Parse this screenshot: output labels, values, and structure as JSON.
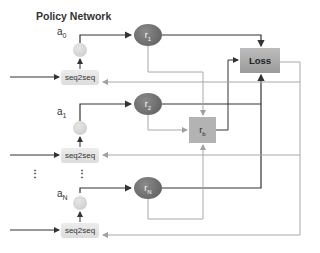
{
  "title": "Policy Network",
  "rows": [
    {
      "action_label": "a",
      "action_sub": "0",
      "reward_label": "r",
      "reward_sub": "1",
      "module_label": "seq2seq"
    },
    {
      "action_label": "a",
      "action_sub": "1",
      "reward_label": "r",
      "reward_sub": "2",
      "module_label": "seq2seq"
    },
    {
      "action_label": "a",
      "action_sub": "N",
      "reward_label": "r",
      "reward_sub": "N",
      "module_label": "seq2seq"
    }
  ],
  "ellipsis": "⋮",
  "baseline": {
    "label": "r",
    "sub": "b"
  },
  "loss": {
    "label": "Loss"
  },
  "colors": {
    "dark_line": "#333333",
    "light_line": "#a8a8a8",
    "reward_node": "#6e6e6e",
    "loss_box": "#a9a9a9",
    "baseline_box": "#b3b3b3",
    "seq2seq_box": "#e2e2e2"
  }
}
